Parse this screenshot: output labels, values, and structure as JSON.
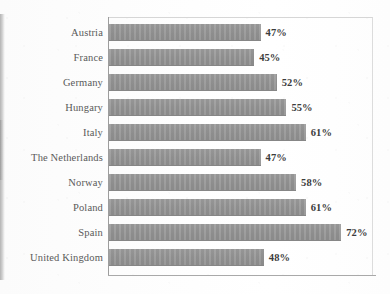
{
  "chart_data": {
    "type": "bar",
    "orientation": "horizontal",
    "title": "",
    "subtitle": "",
    "xlabel": "",
    "ylabel": "",
    "xlim": [
      0,
      80
    ],
    "grid": false,
    "legend": null,
    "value_suffix": "%",
    "categories": [
      "Austria",
      "France",
      "Germany",
      "Hungary",
      "Italy",
      "The Netherlands",
      "Norway",
      "Poland",
      "Spain",
      "United Kingdom"
    ],
    "values": [
      47,
      45,
      52,
      55,
      61,
      47,
      58,
      61,
      72,
      48
    ],
    "data_labels": [
      "47%",
      "45%",
      "52%",
      "55%",
      "61%",
      "47%",
      "58%",
      "61%",
      "72%",
      "48%"
    ],
    "bar_color": "#949494",
    "label_color": "#5a5a5a",
    "value_color": "#3c3c3c",
    "axis_color": "#9d9d9d"
  }
}
